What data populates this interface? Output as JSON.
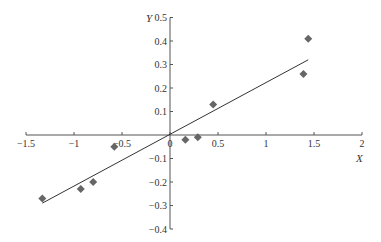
{
  "chart_data": {
    "type": "scatter",
    "title": "",
    "xlabel": "X",
    "ylabel": "Y",
    "xlim": [
      -1.5,
      2
    ],
    "ylim": [
      -0.4,
      0.5
    ],
    "grid": false,
    "legend": null,
    "x_ticks": [
      "-1.5",
      "-1",
      "-0.5",
      "0",
      "0.5",
      "1",
      "1.5",
      "2"
    ],
    "y_ticks": [
      "0.5",
      "0.4",
      "0.3",
      "0.2",
      "0.1",
      "-0.1",
      "-0.2",
      "-0.3",
      "-0.4"
    ],
    "series": [
      {
        "name": "data points",
        "marker": "diamond",
        "color": "#666666",
        "points": [
          {
            "x": -1.33,
            "y": -0.27
          },
          {
            "x": -0.93,
            "y": -0.23
          },
          {
            "x": -0.8,
            "y": -0.2
          },
          {
            "x": -0.58,
            "y": -0.05
          },
          {
            "x": 0.16,
            "y": -0.02
          },
          {
            "x": 0.29,
            "y": -0.01
          },
          {
            "x": 0.45,
            "y": 0.13
          },
          {
            "x": 1.39,
            "y": 0.26
          },
          {
            "x": 1.44,
            "y": 0.41
          }
        ]
      },
      {
        "name": "fitted line",
        "type": "line",
        "color": "#333333",
        "points": [
          {
            "x": -1.33,
            "y": -0.29
          },
          {
            "x": 1.44,
            "y": 0.32
          }
        ]
      }
    ]
  }
}
